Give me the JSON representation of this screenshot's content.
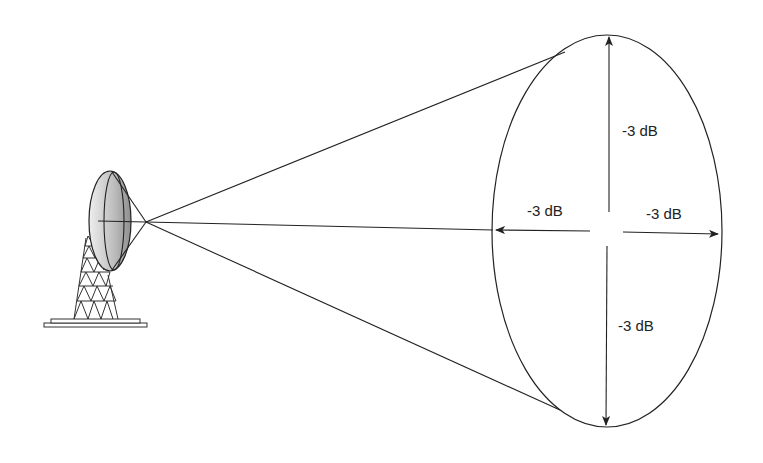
{
  "diagram": {
    "type": "antenna-beamwidth",
    "labels": {
      "top": "-3 dB",
      "left": "-3 dB",
      "right": "-3 dB",
      "bottom": "-3 dB"
    },
    "colors": {
      "stroke": "#222222",
      "dish_fill_light": "#e6e6e6",
      "dish_fill_dark": "#9a9a9a",
      "background": "#ffffff"
    },
    "components": [
      "parabolic-dish-antenna",
      "lattice-tower",
      "base-plate",
      "beam-cone",
      "beam-cross-section-ellipse",
      "half-power-arrows"
    ]
  }
}
